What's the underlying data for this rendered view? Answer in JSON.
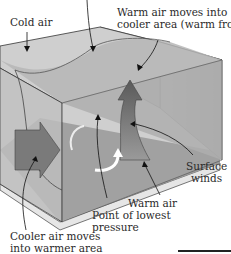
{
  "diagram": {
    "type": "weather-front-3d-block",
    "labels": {
      "cold_air": "Cold air",
      "warm_front_line1": "Warm air moves into",
      "warm_front_line2": "cooler area (warm front).",
      "surface_winds_line1": "Surface",
      "surface_winds_line2": "winds",
      "warm_air": "Warm air",
      "lowest_pressure_line1": "Point of lowest",
      "lowest_pressure_line2": "pressure",
      "cold_front_line1": "Cooler air moves",
      "cold_front_line2": "into warmer area"
    },
    "colors": {
      "box_light": "#d6d6d6",
      "box_mid": "#b4b4b4",
      "box_dark": "#8e8e8e",
      "base": "#e6e6e6",
      "arrow_dark": "#6a6a6a",
      "swirl": "#ffffff",
      "text": "#2a2a2a"
    }
  }
}
